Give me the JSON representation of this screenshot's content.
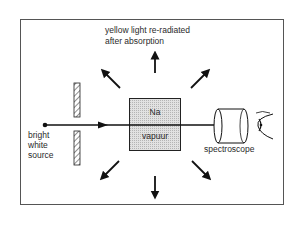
{
  "diagram": {
    "caption_top_line1": "yellow light re-radiated",
    "caption_top_line2": "after absorption",
    "cell_label_top": "Na",
    "cell_label_bottom": "vapuur",
    "source_label_line1": "bright",
    "source_label_line2": "white",
    "source_label_line3": "source",
    "detector_label": "spectroscope",
    "components": [
      "bright white source",
      "slit",
      "Na vapour cell",
      "spectroscope",
      "eye"
    ],
    "arrows": [
      "up",
      "up-left",
      "up-right",
      "down-left",
      "down",
      "down-right"
    ],
    "colors": {
      "ink": "#1a1a1a",
      "cell_fill": "#d9d9d9",
      "frame": "#555555"
    }
  }
}
